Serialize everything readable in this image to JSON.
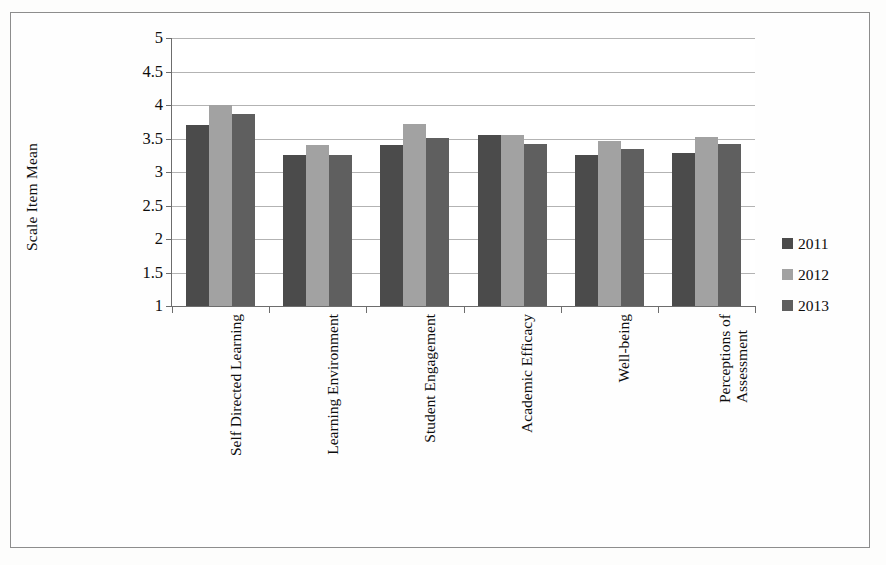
{
  "chart_data": {
    "type": "bar",
    "title": "",
    "xlabel": "",
    "ylabel": "Scale Item Mean",
    "ylim": [
      1,
      5
    ],
    "grid": true,
    "legend_position": "right",
    "y_ticks": [
      "1",
      "1.5",
      "2",
      "2.5",
      "3",
      "3.5",
      "4",
      "4.5",
      "5"
    ],
    "y_tick_values": [
      1,
      1.5,
      2,
      2.5,
      3,
      3.5,
      4,
      4.5,
      5
    ],
    "categories": [
      "Self Directed Learning",
      "Learning Environment",
      "Student Engagement",
      "Academic Efficacy",
      "Well-being",
      "Perceptions of Assessment"
    ],
    "category_lines": [
      [
        "Self Directed Learning"
      ],
      [
        "Learning Environment"
      ],
      [
        "Student Engagement"
      ],
      [
        "Academic Efficacy"
      ],
      [
        "Well-being"
      ],
      [
        "Perceptions of",
        "Assessment"
      ]
    ],
    "series": [
      {
        "name": "2011",
        "color": "#4b4b4b",
        "values": [
          3.7,
          3.25,
          3.4,
          3.55,
          3.25,
          3.28
        ]
      },
      {
        "name": "2012",
        "color": "#a2a2a2",
        "values": [
          4.0,
          3.4,
          3.72,
          3.55,
          3.47,
          3.52
        ]
      },
      {
        "name": "2013",
        "color": "#5f5f5f",
        "values": [
          3.86,
          3.25,
          3.51,
          3.42,
          3.35,
          3.42
        ]
      }
    ]
  },
  "legend": {
    "items": [
      {
        "label": "2011",
        "color": "#4b4b4b"
      },
      {
        "label": "2012",
        "color": "#a2a2a2"
      },
      {
        "label": "2013",
        "color": "#5f5f5f"
      }
    ]
  },
  "axis": {
    "y_title": "Scale Item Mean"
  }
}
